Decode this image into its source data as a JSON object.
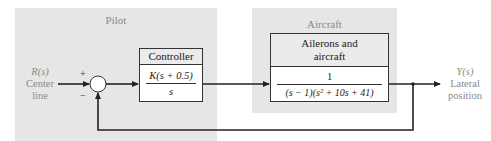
{
  "panels": {
    "pilot": {
      "title": "Pilot"
    },
    "aircraft": {
      "title": "Aircraft"
    }
  },
  "input": {
    "symbol": "R(s)",
    "line1": "Center",
    "line2": "line"
  },
  "output": {
    "symbol": "Y(s)",
    "line1": "Lateral",
    "line2": "position"
  },
  "summing_junction": {
    "plus": "+",
    "minus": "−"
  },
  "controller": {
    "title": "Controller",
    "numerator": "K(s + 0.5)",
    "denominator": "s"
  },
  "plant": {
    "title_line1": "Ailerons and",
    "title_line2": "aircraft",
    "numerator": "1",
    "denominator": "(s − 1)(s² + 10s + 41)"
  },
  "colors": {
    "panel_bg": "#e6e6e6",
    "line": "#222222",
    "label_gray": "#8a8a8a"
  }
}
